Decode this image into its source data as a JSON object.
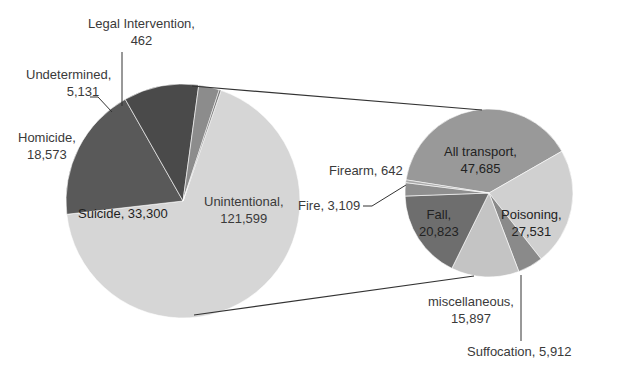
{
  "chart_data": {
    "type": "pie",
    "subtype": "pie-of-pie",
    "title": "",
    "primary": {
      "categories": [
        "Unintentional",
        "Suicide",
        "Homicide",
        "Undetermined",
        "Legal Intervention"
      ],
      "values": [
        121599,
        33300,
        18573,
        5131,
        462
      ],
      "colors": [
        "#d6d6d6",
        "#595959",
        "#4a4a4a",
        "#8c8c8c",
        "#707070"
      ]
    },
    "secondary": {
      "parent": "Unintentional",
      "categories": [
        "All transport",
        "Poisoning",
        "Suffocation",
        "miscellaneous",
        "Fall",
        "Fire",
        "Firearm"
      ],
      "values": [
        47685,
        27531,
        5912,
        15897,
        20823,
        3109,
        642
      ],
      "colors": [
        "#999999",
        "#d0d0d0",
        "#8a8a8a",
        "#c4c4c4",
        "#6e6e6e",
        "#8f8f8f",
        "#a8a8a8"
      ]
    },
    "labels": {
      "legal": {
        "name": "Legal Intervention,",
        "value": "462"
      },
      "undetermined": {
        "name": "Undetermined,",
        "value": "5,131"
      },
      "homicide": {
        "name": "Homicide,",
        "value": "18,573"
      },
      "suicide": {
        "name": "Suicide, 33,300"
      },
      "unintentional": {
        "name": "Unintentional,",
        "value": "121,599"
      },
      "transport": {
        "name": "All transport,",
        "value": "47,685"
      },
      "firearm": {
        "name": "Firearm, 642"
      },
      "fire": {
        "name": "Fire, 3,109"
      },
      "fall": {
        "name": "Fall,",
        "value": "20,823"
      },
      "poisoning": {
        "name": "Poisoning,",
        "value": "27,531"
      },
      "misc": {
        "name": "miscellaneous,",
        "value": "15,897"
      },
      "suffocation": {
        "name": "Suffocation, 5,912"
      }
    },
    "legend": "none"
  }
}
